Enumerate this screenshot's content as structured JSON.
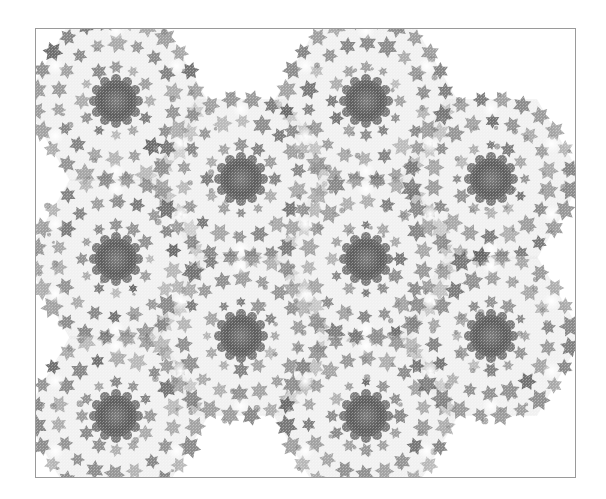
{
  "figure": {
    "frame": {
      "left": 35,
      "top": 28,
      "width": 541,
      "height": 450,
      "border_color": "#9a9a9a"
    },
    "palette": {
      "background": "#ffffff",
      "core": "#6a6a6a",
      "petal": "#7c7c7c",
      "light": "#b8b8b8",
      "halo": "#e6e6e6"
    },
    "hex_radius": 92,
    "clusters": [
      {
        "cx": 115,
        "cy": 100
      },
      {
        "cx": 115,
        "cy": 258
      },
      {
        "cx": 115,
        "cy": 415
      },
      {
        "cx": 240,
        "cy": 178
      },
      {
        "cx": 240,
        "cy": 335
      },
      {
        "cx": 365,
        "cy": 100
      },
      {
        "cx": 365,
        "cy": 258
      },
      {
        "cx": 365,
        "cy": 415
      },
      {
        "cx": 490,
        "cy": 178
      },
      {
        "cx": 490,
        "cy": 335
      }
    ]
  }
}
